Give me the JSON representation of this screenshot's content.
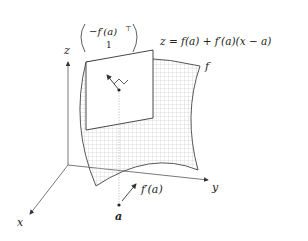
{
  "diagram": {
    "axes": {
      "x_label": "x",
      "y_label": "y",
      "z_label": "z"
    },
    "normal_vector": {
      "top": "−f′(a)",
      "top_superscript": "⊤",
      "bottom": "1"
    },
    "tangent_plane_equation": {
      "lhs": "z",
      "eq": " = ",
      "rhs": "f(a) + f′(a)(x − a)"
    },
    "surface_label": "f",
    "point_label": "a",
    "gradient_label": "f′(a)",
    "colors": {
      "line": "#333333",
      "grid": "#b5b5b5",
      "plane_fill": "#ffffff",
      "text": "#222222"
    }
  }
}
